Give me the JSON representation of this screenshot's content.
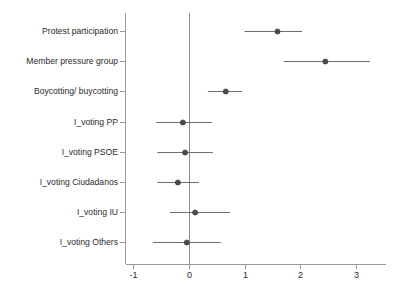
{
  "chart_data": {
    "type": "scatter",
    "subtype": "forest-coefficient-plot",
    "title": "",
    "subtitle": "",
    "xlabel": "",
    "ylabel": "",
    "xlim": [
      -1.35,
      3.4
    ],
    "xticks": [
      -1,
      0,
      1,
      2,
      3
    ],
    "xticklabels": [
      "-1",
      "0",
      "1",
      "2",
      "3"
    ],
    "grid": false,
    "legend": null,
    "reference_line": 0,
    "categories": [
      "Protest participation",
      "Member pressure group",
      "Boycotting/ buycotting",
      "I_voting PP",
      "I_voting PSOE",
      "I_voting Ciudadanos",
      "I_voting IU",
      "I_voting Others"
    ],
    "points": [
      {
        "label": "Protest participation",
        "estimate": 1.59,
        "ci_low": 1.0,
        "ci_high": 2.03
      },
      {
        "label": "Member pressure group",
        "estimate": 2.45,
        "ci_low": 1.7,
        "ci_high": 3.25
      },
      {
        "label": "Boycotting/ buycotting",
        "estimate": 0.66,
        "ci_low": 0.34,
        "ci_high": 0.95
      },
      {
        "label": "I_voting PP",
        "estimate": -0.11,
        "ci_low": -0.59,
        "ci_high": 0.41
      },
      {
        "label": "I_voting PSOE",
        "estimate": -0.07,
        "ci_low": -0.57,
        "ci_high": 0.43
      },
      {
        "label": "I_voting Ciudadanos",
        "estimate": -0.2,
        "ci_low": -0.57,
        "ci_high": 0.18
      },
      {
        "label": "I_voting IU",
        "estimate": 0.11,
        "ci_low": -0.34,
        "ci_high": 0.74
      },
      {
        "label": "I_voting Others",
        "estimate": -0.04,
        "ci_low": -0.65,
        "ci_high": 0.57
      }
    ],
    "colors": {
      "marker": "#4a4a4a",
      "ci": "#6e6e6e",
      "axis": "#9a9a9a",
      "zero_line": "#8d8d8d",
      "text": "#2b2b2b",
      "background": "#ffffff"
    }
  }
}
